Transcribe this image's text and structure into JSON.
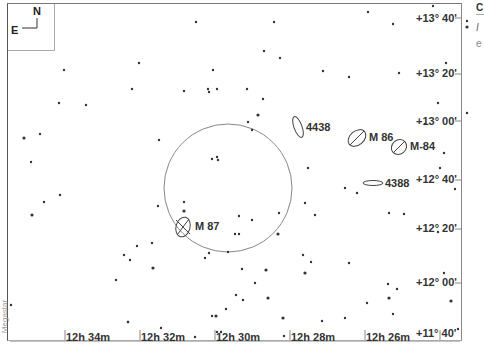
{
  "compass": {
    "north": "N",
    "east": "E"
  },
  "dec_labels": [
    {
      "text": "+13° 40'",
      "x": 416,
      "y": 12
    },
    {
      "text": "+13° 20'",
      "x": 416,
      "y": 67
    },
    {
      "text": "+13° 00'",
      "x": 416,
      "y": 115
    },
    {
      "text": "+12° 40'",
      "x": 416,
      "y": 173
    },
    {
      "text": "+12° 20'",
      "x": 416,
      "y": 222
    },
    {
      "text": "+12° 00'",
      "x": 416,
      "y": 276
    },
    {
      "text": "+11° 40'",
      "x": 416,
      "y": 327
    }
  ],
  "ra_labels": [
    {
      "text": "12h 34m",
      "x": 66,
      "y": 331
    },
    {
      "text": "12h 32m",
      "x": 141,
      "y": 331
    },
    {
      "text": "12h 30m",
      "x": 216,
      "y": 331
    },
    {
      "text": "12h 28m",
      "x": 291,
      "y": 331
    },
    {
      "text": "12h 26m",
      "x": 366,
      "y": 331
    }
  ],
  "objects": [
    {
      "name": "4438",
      "x": 306,
      "y": 123
    },
    {
      "name": "M 86",
      "x": 369,
      "y": 131
    },
    {
      "name": "M-84",
      "x": 410,
      "y": 140
    },
    {
      "name": "4388",
      "x": 385,
      "y": 177
    },
    {
      "name": "M 87",
      "x": 195,
      "y": 220
    }
  ],
  "credit": "Megastar",
  "side_panel": {
    "title": "C",
    "line1": "I",
    "line2": "e"
  },
  "colors": {
    "ink": "#333333",
    "circle": "#888888",
    "frame": "#666666"
  }
}
